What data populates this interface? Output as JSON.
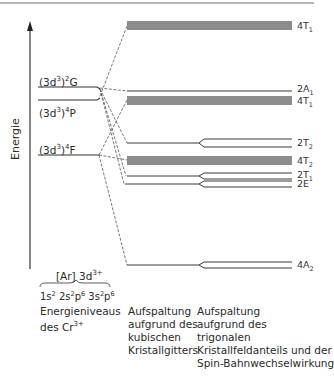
{
  "diagram": {
    "axis_label": "Energie",
    "free_ion_levels": [
      {
        "id": "2G",
        "label_main": "(3d",
        "label_sup1": "3",
        "label_mid": ")",
        "label_sup2": "2",
        "label_term": "G"
      },
      {
        "id": "4P",
        "label_main": "(3d",
        "label_sup1": "3",
        "label_mid": ")",
        "label_sup2": "4",
        "label_term": "P"
      },
      {
        "id": "4F",
        "label_main": "(3d",
        "label_sup1": "3",
        "label_mid": ")",
        "label_sup2": "4",
        "label_term": "F"
      }
    ],
    "crystal_field_levels": [
      {
        "id": "4T1_upper",
        "mult": "4",
        "sym": "T",
        "sub": "1",
        "style": "band"
      },
      {
        "id": "2A1",
        "mult": "2",
        "sym": "A",
        "sub": "1",
        "style": "line"
      },
      {
        "id": "4T1_lower",
        "mult": "4",
        "sym": "T",
        "sub": "1",
        "style": "band"
      },
      {
        "id": "2T2",
        "mult": "2",
        "sym": "T",
        "sub": "2",
        "style": "split"
      },
      {
        "id": "4T2",
        "mult": "4",
        "sym": "T",
        "sub": "2",
        "style": "band"
      },
      {
        "id": "2T1",
        "mult": "2",
        "sym": "T",
        "sub": "1",
        "style": "split"
      },
      {
        "id": "2E",
        "mult": "2",
        "sym": "E",
        "sub": "",
        "style": "split"
      },
      {
        "id": "4A2",
        "mult": "4",
        "sym": "A",
        "sub": "2",
        "style": "split"
      }
    ],
    "configuration": {
      "top_main": "[Ar] 3d",
      "top_sup": "3+",
      "bottom": [
        {
          "t": "1s",
          "s": "2"
        },
        {
          "t": " 2s",
          "s": "2"
        },
        {
          "t": "p",
          "s": "6"
        },
        {
          "t": " 3s",
          "s": "2"
        },
        {
          "t": "p",
          "s": "6"
        }
      ]
    },
    "captions": {
      "left": {
        "line1": "Energieniveaus",
        "line2_main": "des Cr",
        "line2_sup": "3+"
      },
      "middle": [
        "Aufspaltung",
        "aufgrund des",
        "kubischen",
        "Kristallgitters"
      ],
      "right": [
        "Aufspaltung",
        "aufgrund des",
        "trigonalen",
        "Kristallfeldanteils und der",
        "Spin-Bahnwechselwirkung"
      ]
    },
    "colors": {
      "line": "#3a3a3a",
      "band": "#8c8c8c",
      "dashed": "#555555",
      "rule": "#6a6a6a"
    }
  }
}
